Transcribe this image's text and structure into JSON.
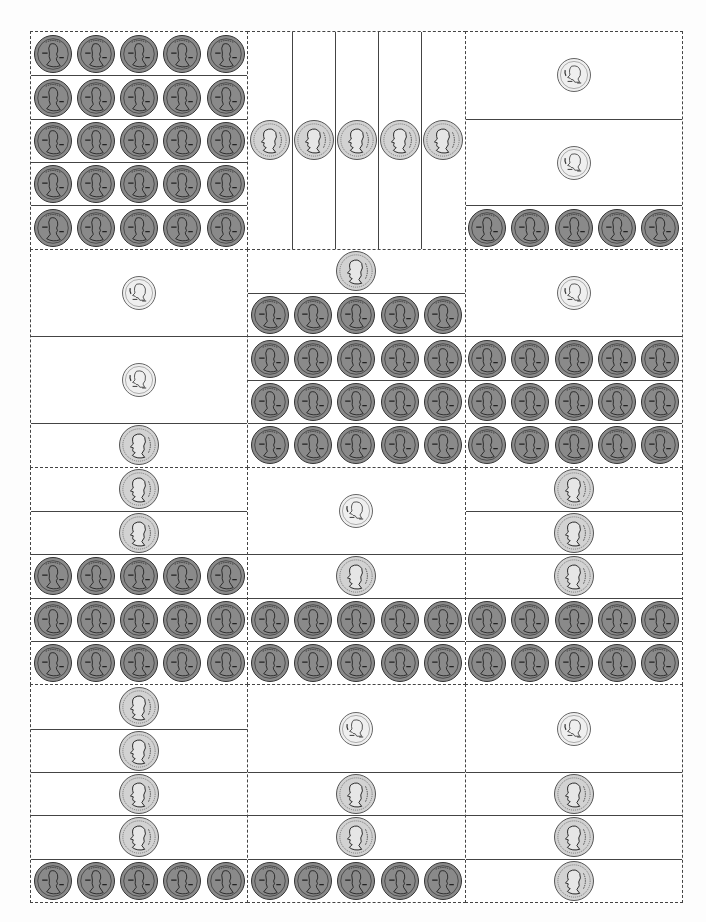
{
  "colors": {
    "line": "#444444",
    "penny": "#8a8a8a",
    "nickel": "#d2d2d2",
    "dime": "#efefef"
  },
  "coin_icons": {
    "penny": "penny-icon",
    "nickel": "nickel-icon",
    "dime": "dime-icon"
  },
  "cards": [
    {
      "id": "c1r1",
      "orientation": "h",
      "strips": [
        {
          "coin": "penny",
          "count": 5,
          "units": 1
        },
        {
          "coin": "penny",
          "count": 5,
          "units": 1
        },
        {
          "coin": "penny",
          "count": 5,
          "units": 1
        },
        {
          "coin": "penny",
          "count": 5,
          "units": 1
        },
        {
          "coin": "penny",
          "count": 5,
          "units": 1
        }
      ]
    },
    {
      "id": "c2r1",
      "orientation": "v",
      "strips": [
        {
          "coin": "nickel",
          "count": 1,
          "units": 1
        },
        {
          "coin": "nickel",
          "count": 1,
          "units": 1
        },
        {
          "coin": "nickel",
          "count": 1,
          "units": 1
        },
        {
          "coin": "nickel",
          "count": 1,
          "units": 1
        },
        {
          "coin": "nickel",
          "count": 1,
          "units": 1
        }
      ]
    },
    {
      "id": "c3r1",
      "orientation": "h",
      "strips": [
        {
          "coin": "dime",
          "count": 1,
          "units": 2
        },
        {
          "coin": "dime",
          "count": 1,
          "units": 2
        },
        {
          "coin": "penny",
          "count": 5,
          "units": 1
        }
      ]
    },
    {
      "id": "c1r2",
      "orientation": "h",
      "strips": [
        {
          "coin": "dime",
          "count": 1,
          "units": 2
        },
        {
          "coin": "dime",
          "count": 1,
          "units": 2
        },
        {
          "coin": "nickel",
          "count": 1,
          "units": 1
        }
      ]
    },
    {
      "id": "c2r2",
      "orientation": "h",
      "strips": [
        {
          "coin": "nickel",
          "count": 1,
          "units": 1
        },
        {
          "coin": "penny",
          "count": 5,
          "units": 1
        },
        {
          "coin": "penny",
          "count": 5,
          "units": 1
        },
        {
          "coin": "penny",
          "count": 5,
          "units": 1
        },
        {
          "coin": "penny",
          "count": 5,
          "units": 1
        }
      ]
    },
    {
      "id": "c3r2",
      "orientation": "h",
      "strips": [
        {
          "coin": "dime",
          "count": 1,
          "units": 2
        },
        {
          "coin": "penny",
          "count": 5,
          "units": 1
        },
        {
          "coin": "penny",
          "count": 5,
          "units": 1
        },
        {
          "coin": "penny",
          "count": 5,
          "units": 1
        }
      ]
    },
    {
      "id": "c1r3",
      "orientation": "h",
      "strips": [
        {
          "coin": "nickel",
          "count": 1,
          "units": 1
        },
        {
          "coin": "nickel",
          "count": 1,
          "units": 1
        },
        {
          "coin": "penny",
          "count": 5,
          "units": 1
        },
        {
          "coin": "penny",
          "count": 5,
          "units": 1
        },
        {
          "coin": "penny",
          "count": 5,
          "units": 1
        }
      ]
    },
    {
      "id": "c2r3",
      "orientation": "h",
      "strips": [
        {
          "coin": "dime",
          "count": 1,
          "units": 2
        },
        {
          "coin": "nickel",
          "count": 1,
          "units": 1
        },
        {
          "coin": "penny",
          "count": 5,
          "units": 1
        },
        {
          "coin": "penny",
          "count": 5,
          "units": 1
        }
      ]
    },
    {
      "id": "c3r3",
      "orientation": "h",
      "strips": [
        {
          "coin": "nickel",
          "count": 1,
          "units": 1
        },
        {
          "coin": "nickel",
          "count": 1,
          "units": 1
        },
        {
          "coin": "nickel",
          "count": 1,
          "units": 1
        },
        {
          "coin": "penny",
          "count": 5,
          "units": 1
        },
        {
          "coin": "penny",
          "count": 5,
          "units": 1
        }
      ]
    },
    {
      "id": "c1r4",
      "orientation": "h",
      "strips": [
        {
          "coin": "nickel",
          "count": 1,
          "units": 1
        },
        {
          "coin": "nickel",
          "count": 1,
          "units": 1
        },
        {
          "coin": "nickel",
          "count": 1,
          "units": 1
        },
        {
          "coin": "nickel",
          "count": 1,
          "units": 1
        },
        {
          "coin": "penny",
          "count": 5,
          "units": 1
        }
      ]
    },
    {
      "id": "c2r4",
      "orientation": "h",
      "strips": [
        {
          "coin": "dime",
          "count": 1,
          "units": 2
        },
        {
          "coin": "nickel",
          "count": 1,
          "units": 1
        },
        {
          "coin": "nickel",
          "count": 1,
          "units": 1
        },
        {
          "coin": "penny",
          "count": 5,
          "units": 1
        }
      ]
    },
    {
      "id": "c3r4",
      "orientation": "h",
      "strips": [
        {
          "coin": "dime",
          "count": 1,
          "units": 2
        },
        {
          "coin": "nickel",
          "count": 1,
          "units": 1
        },
        {
          "coin": "nickel",
          "count": 1,
          "units": 1
        },
        {
          "coin": "nickel",
          "count": 1,
          "units": 1
        }
      ]
    }
  ]
}
